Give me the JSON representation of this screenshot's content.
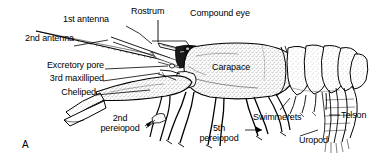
{
  "figure": {
    "panel_letter": "A",
    "view": "lateral",
    "ink_color": "#000000",
    "background_color": "#ffffff"
  },
  "labels": {
    "first_antenna": "1st antenna",
    "second_antenna": "2nd antenna",
    "rostrum": "Rostrum",
    "compound_eye": "Compound eye",
    "excretory_pore": "Excretory pore",
    "third_maxilliped": "3rd maxilliped",
    "cheliped": "Cheliped",
    "carapace": "Carapace",
    "second_pereiopod_line1": "2nd",
    "second_pereiopod_line2": "pereiopod",
    "fifth_pereiopod_line1": "5th",
    "fifth_pereiopod_line2": "pereiopod",
    "swimmerets": "Swimmerets",
    "telson": "Telson",
    "uropod": "Uropod"
  }
}
